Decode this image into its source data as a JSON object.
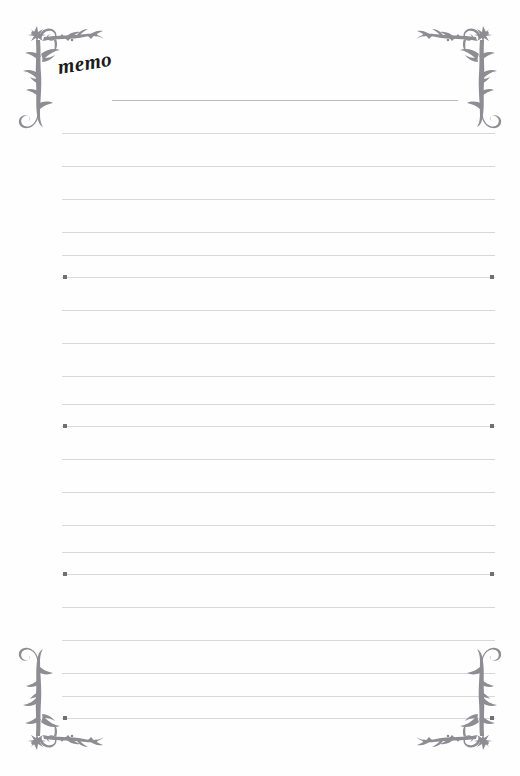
{
  "page": {
    "width": 520,
    "height": 776,
    "background_color": "#fefefe",
    "title": "memo",
    "title_rotation_deg": -9
  },
  "theme": {
    "ornament_color": "#8d8d93",
    "rule_color": "#d7d7dc",
    "title_rule_color": "#b9b9bf",
    "dot_color": "#6f6f76",
    "title_text_color": "#1c1c1c"
  },
  "ornaments": [
    {
      "name": "top-left",
      "label": "floral vine corner flourish"
    },
    {
      "name": "top-right",
      "label": "floral vine corner flourish"
    },
    {
      "name": "bottom-left",
      "label": "floral vine corner flourish"
    },
    {
      "name": "bottom-right",
      "label": "floral vine corner flourish"
    }
  ],
  "rules": [
    {
      "y": 100,
      "x": 112,
      "width": 346,
      "title_rule": true,
      "dot_left": false,
      "dot_right": false
    },
    {
      "y": 133,
      "x": 62,
      "width": 433,
      "title_rule": false,
      "dot_left": false,
      "dot_right": false
    },
    {
      "y": 166,
      "x": 62,
      "width": 433,
      "title_rule": false,
      "dot_left": false,
      "dot_right": false
    },
    {
      "y": 199,
      "x": 62,
      "width": 433,
      "title_rule": false,
      "dot_left": false,
      "dot_right": false
    },
    {
      "y": 232,
      "x": 62,
      "width": 433,
      "title_rule": false,
      "dot_left": false,
      "dot_right": false
    },
    {
      "y": 255,
      "x": 62,
      "width": 433,
      "title_rule": false,
      "dot_left": false,
      "dot_right": false
    },
    {
      "y": 277,
      "x": 62,
      "width": 433,
      "title_rule": false,
      "dot_left": true,
      "dot_right": true
    },
    {
      "y": 310,
      "x": 62,
      "width": 433,
      "title_rule": false,
      "dot_left": false,
      "dot_right": false
    },
    {
      "y": 343,
      "x": 62,
      "width": 433,
      "title_rule": false,
      "dot_left": false,
      "dot_right": false
    },
    {
      "y": 376,
      "x": 62,
      "width": 433,
      "title_rule": false,
      "dot_left": false,
      "dot_right": false
    },
    {
      "y": 404,
      "x": 62,
      "width": 433,
      "title_rule": false,
      "dot_left": false,
      "dot_right": false
    },
    {
      "y": 426,
      "x": 62,
      "width": 433,
      "title_rule": false,
      "dot_left": true,
      "dot_right": true
    },
    {
      "y": 459,
      "x": 62,
      "width": 433,
      "title_rule": false,
      "dot_left": false,
      "dot_right": false
    },
    {
      "y": 492,
      "x": 62,
      "width": 433,
      "title_rule": false,
      "dot_left": false,
      "dot_right": false
    },
    {
      "y": 525,
      "x": 62,
      "width": 433,
      "title_rule": false,
      "dot_left": false,
      "dot_right": false
    },
    {
      "y": 552,
      "x": 62,
      "width": 433,
      "title_rule": false,
      "dot_left": false,
      "dot_right": false
    },
    {
      "y": 574,
      "x": 62,
      "width": 433,
      "title_rule": false,
      "dot_left": true,
      "dot_right": true
    },
    {
      "y": 607,
      "x": 62,
      "width": 433,
      "title_rule": false,
      "dot_left": false,
      "dot_right": false
    },
    {
      "y": 640,
      "x": 62,
      "width": 433,
      "title_rule": false,
      "dot_left": false,
      "dot_right": false
    },
    {
      "y": 673,
      "x": 62,
      "width": 433,
      "title_rule": false,
      "dot_left": false,
      "dot_right": false
    },
    {
      "y": 696,
      "x": 62,
      "width": 433,
      "title_rule": false,
      "dot_left": false,
      "dot_right": false
    },
    {
      "y": 718,
      "x": 62,
      "width": 433,
      "title_rule": false,
      "dot_left": true,
      "dot_right": true
    }
  ]
}
